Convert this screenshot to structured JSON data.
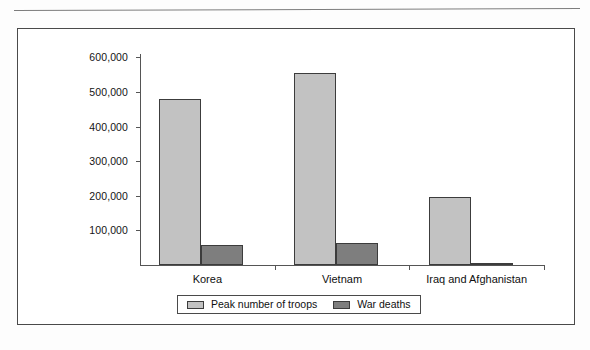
{
  "page": {
    "ghost_text": "",
    "background_note": "scanned-page"
  },
  "chart_data": {
    "type": "bar",
    "title": "",
    "xlabel": "",
    "ylabel": "",
    "ylim": [
      0,
      620000
    ],
    "grid": false,
    "legend_position": "bottom",
    "categories": [
      "Korea",
      "Vietnam",
      "Iraq and Afghanistan"
    ],
    "ytick_labels": [
      "600,000",
      "500,000",
      "400,000",
      "300,000",
      "200,000",
      "100,000"
    ],
    "ytick_values": [
      600000,
      500000,
      400000,
      300000,
      200000,
      100000
    ],
    "series": [
      {
        "name": "Peak number of troops",
        "color": "#c2c2c2",
        "values": [
          480000,
          555000,
          197000
        ]
      },
      {
        "name": "War deaths",
        "color": "#7e7e7e",
        "values": [
          57000,
          65000,
          7000
        ]
      }
    ]
  }
}
